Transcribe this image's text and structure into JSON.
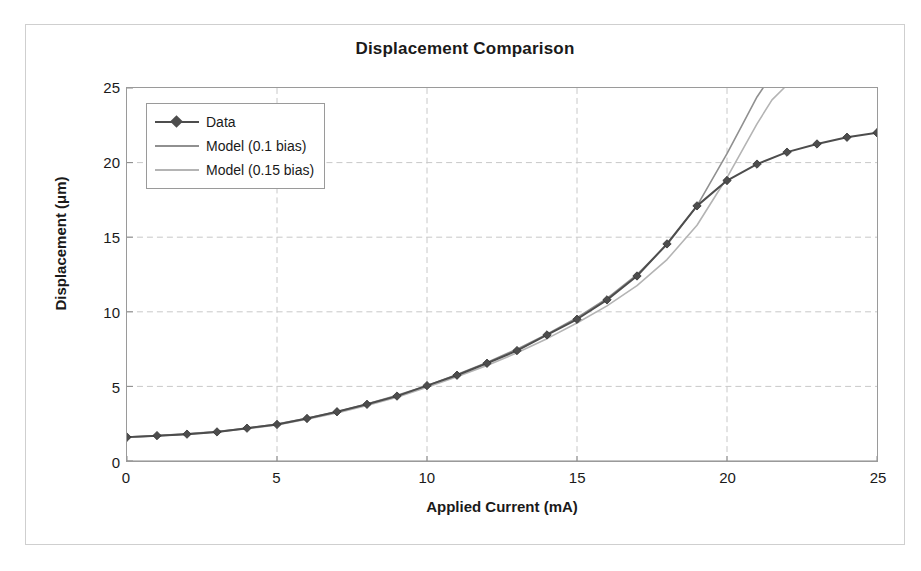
{
  "chart_data": {
    "type": "line",
    "title": "Displacement Comparison",
    "xlabel": "Applied Current (mA)",
    "ylabel": "Displacement (μm)",
    "xlim": [
      0,
      25
    ],
    "ylim": [
      0,
      25
    ],
    "xticks": [
      0,
      5,
      10,
      15,
      20,
      25
    ],
    "yticks": [
      0,
      5,
      10,
      15,
      20,
      25
    ],
    "grid": true,
    "legend_position": "upper left",
    "series": [
      {
        "name": "Data",
        "marker": "diamond",
        "color": "#4d4d4d",
        "x": [
          0,
          1,
          2,
          3,
          4,
          5,
          6,
          7,
          8,
          9,
          10,
          11,
          12,
          13,
          14,
          15,
          16,
          17,
          18,
          19,
          20,
          21,
          22,
          23,
          24,
          25
        ],
        "values": [
          1.6,
          1.7,
          1.8,
          1.95,
          2.2,
          2.45,
          2.85,
          3.3,
          3.8,
          4.35,
          5.05,
          5.75,
          6.55,
          7.4,
          8.45,
          9.5,
          10.8,
          12.4,
          14.55,
          17.1,
          18.8,
          19.9,
          20.7,
          21.25,
          21.7,
          22.0
        ]
      },
      {
        "name": "Model (0.1 bias)",
        "marker": "none",
        "color": "#909090",
        "x": [
          0,
          1,
          2,
          3,
          4,
          5,
          6,
          7,
          8,
          9,
          10,
          11,
          12,
          13,
          14,
          15,
          16,
          17,
          18,
          19,
          20,
          20.5,
          21,
          21.2
        ],
        "values": [
          1.6,
          1.7,
          1.82,
          1.98,
          2.2,
          2.48,
          2.86,
          3.3,
          3.82,
          4.4,
          5.05,
          5.8,
          6.6,
          7.5,
          8.5,
          9.6,
          10.9,
          12.5,
          14.5,
          17.1,
          20.6,
          22.5,
          24.4,
          25.0
        ]
      },
      {
        "name": "Model (0.15 bias)",
        "marker": "none",
        "color": "#b4b4b4",
        "x": [
          0,
          1,
          2,
          3,
          4,
          5,
          6,
          7,
          8,
          9,
          10,
          11,
          12,
          13,
          14,
          15,
          16,
          17,
          18,
          19,
          20,
          21,
          21.5,
          21.9
        ],
        "values": [
          1.58,
          1.68,
          1.8,
          1.95,
          2.16,
          2.42,
          2.8,
          3.22,
          3.72,
          4.28,
          4.95,
          5.65,
          6.4,
          7.25,
          8.2,
          9.25,
          10.4,
          11.75,
          13.5,
          15.8,
          19.0,
          22.6,
          24.2,
          25.0
        ]
      }
    ]
  },
  "legend": {
    "entries": [
      {
        "label": "Data"
      },
      {
        "label": "Model (0.1 bias)"
      },
      {
        "label": "Model (0.15 bias)"
      }
    ]
  }
}
